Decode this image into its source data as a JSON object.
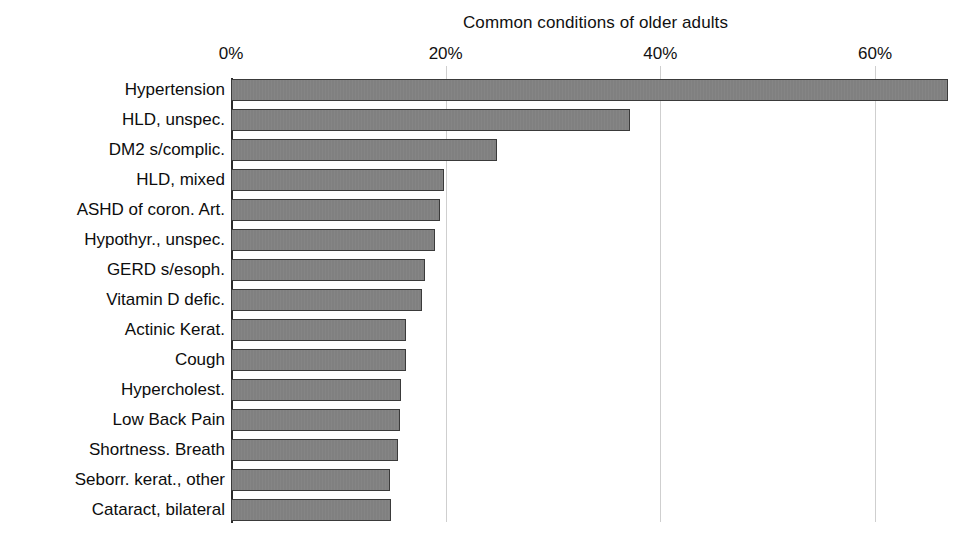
{
  "chart_data": {
    "type": "bar",
    "orientation": "horizontal",
    "title": "Common conditions of older adults",
    "xlabel": "",
    "ylabel": "",
    "xlim": [
      0,
      66.8
    ],
    "grid": true,
    "legend": null,
    "axis_position": "top",
    "tick_labels": [
      "0%",
      "20%",
      "40%",
      "60%"
    ],
    "tick_values": [
      0,
      20,
      40,
      60
    ],
    "categories": [
      "Hypertension",
      "HLD, unspec.",
      "DM2 s/complic.",
      "HLD, mixed",
      "ASHD of coron. Art.",
      "Hypothyr., unspec.",
      "GERD s/esoph.",
      "Vitamin D defic.",
      "Actinic Kerat.",
      "Cough",
      "Hypercholest.",
      "Low Back Pain",
      "Shortness. Breath",
      "Seborr. kerat., other",
      "Cataract, bilateral"
    ],
    "values": [
      66.8,
      37.2,
      24.8,
      19.8,
      19.5,
      19.0,
      18.1,
      17.8,
      16.3,
      16.3,
      15.8,
      15.7,
      15.6,
      14.8,
      14.9
    ],
    "bar_color": "#808080",
    "bar_border_color": "#3a3a3a",
    "gridline_color": "#cfcfcf",
    "axis_color": "#2b2b2b",
    "background_color": "#ffffff"
  }
}
